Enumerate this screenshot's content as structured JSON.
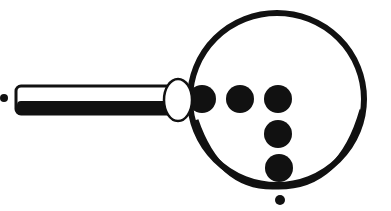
{
  "diagram": {
    "colors": {
      "ink": "#111111",
      "background": "#ffffff"
    },
    "handle": {
      "x": 16,
      "y": 86,
      "width": 156,
      "height": 28
    },
    "ferrule": {
      "cx": 178,
      "cy": 100,
      "rx": 15,
      "ry": 22
    },
    "lens": {
      "cx": 277,
      "cy": 99,
      "rx": 89,
      "ry": 88
    },
    "dots": [
      {
        "cx": 202,
        "cy": 99,
        "r": 14
      },
      {
        "cx": 240,
        "cy": 99,
        "r": 14
      },
      {
        "cx": 278,
        "cy": 99,
        "r": 14
      },
      {
        "cx": 278,
        "cy": 134,
        "r": 14
      },
      {
        "cx": 279,
        "cy": 168,
        "r": 14
      }
    ],
    "small_dots": [
      {
        "cx": 4,
        "cy": 98,
        "r": 4
      },
      {
        "cx": 280,
        "cy": 200,
        "r": 5
      }
    ]
  }
}
